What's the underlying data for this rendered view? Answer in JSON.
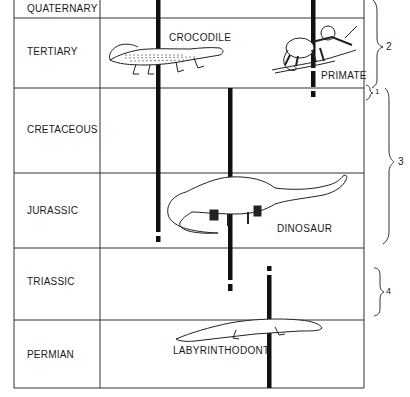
{
  "periods": [
    {
      "name": "QUATERNARY",
      "top": 0,
      "bottom": 18
    },
    {
      "name": "TERTIARY",
      "top": 18,
      "bottom": 88
    },
    {
      "name": "CRETACEOUS",
      "top": 88,
      "bottom": 173
    },
    {
      "name": "JURASSIC",
      "top": 173,
      "bottom": 248
    },
    {
      "name": "TRIASSIC",
      "top": 248,
      "bottom": 320
    },
    {
      "name": "PERMIAN",
      "top": 320,
      "bottom": 388
    }
  ],
  "animals": [
    {
      "name": "CROCODILE",
      "line_x": 158
    },
    {
      "name": "PRIMATE",
      "line_x": 313
    },
    {
      "name": "DINOSAUR",
      "line_x": 230
    },
    {
      "name": "LABYRINTHODONT",
      "line_x": 268
    }
  ],
  "braces": [
    {
      "label": "1"
    },
    {
      "label": "2"
    },
    {
      "label": "3"
    },
    {
      "label": "4"
    }
  ]
}
